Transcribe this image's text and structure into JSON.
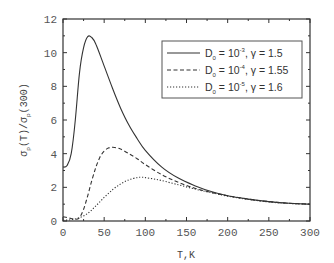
{
  "chart_data": {
    "type": "line",
    "title": "",
    "xlabel": "T,K",
    "ylabel": "σp(T)/σp(300)",
    "ylabel_parts": {
      "sigma": "σ",
      "sub": "p",
      "num_arg": "(T)",
      "slash": "/",
      "den_arg": "(300)"
    },
    "xlim": [
      0,
      300
    ],
    "ylim": [
      0,
      12
    ],
    "x_ticks": [
      0,
      50,
      100,
      150,
      200,
      250,
      300
    ],
    "x_tick_labels": [
      "0",
      "50",
      "100",
      "150",
      "200",
      "250",
      "300"
    ],
    "x_minor_ticks": [
      25,
      75,
      125,
      175,
      225,
      275
    ],
    "y_ticks": [
      0,
      2,
      4,
      6,
      8,
      10,
      12
    ],
    "y_tick_labels": [
      "0",
      "2",
      "4",
      "6",
      "8",
      "10",
      "12"
    ],
    "y_minor_ticks": [
      1,
      3,
      5,
      7,
      9,
      11
    ],
    "grid": false,
    "legend_position": "upper right",
    "series": [
      {
        "name": "D0 = 10^-3, γ = 1.5",
        "legend": {
          "d": "D",
          "sub": "0",
          "eq": " = 10",
          "sup": "-3",
          "rest": ", γ = 1.5"
        },
        "style": "solid",
        "x": [
          0,
          5,
          10,
          15,
          20,
          25,
          30,
          35,
          40,
          50,
          60,
          70,
          80,
          90,
          100,
          120,
          140,
          160,
          180,
          200,
          225,
          250,
          275,
          300
        ],
        "y": [
          3.2,
          3.3,
          4.0,
          6.0,
          8.8,
          10.3,
          10.95,
          10.9,
          10.5,
          9.2,
          7.9,
          6.7,
          5.7,
          4.9,
          4.2,
          3.2,
          2.55,
          2.1,
          1.75,
          1.5,
          1.3,
          1.15,
          1.05,
          1.0
        ]
      },
      {
        "name": "D0 = 10^-4, γ = 1.55",
        "legend": {
          "d": "D",
          "sub": "0",
          "eq": " = 10",
          "sup": "-4",
          "rest": ", γ = 1.55"
        },
        "style": "dashed",
        "x": [
          0,
          5,
          10,
          15,
          20,
          25,
          30,
          35,
          40,
          45,
          50,
          55,
          60,
          65,
          70,
          80,
          90,
          100,
          120,
          140,
          160,
          180,
          200,
          225,
          250,
          275,
          300
        ],
        "y": [
          0.25,
          0.2,
          0.15,
          0.1,
          0.2,
          0.7,
          1.5,
          2.4,
          3.2,
          3.8,
          4.15,
          4.33,
          4.38,
          4.35,
          4.28,
          4.0,
          3.7,
          3.35,
          2.75,
          2.3,
          1.95,
          1.7,
          1.5,
          1.3,
          1.15,
          1.05,
          1.0
        ]
      },
      {
        "name": "D0 = 10^-5, γ = 1.6",
        "legend": {
          "d": "D",
          "sub": "0",
          "eq": " = 10",
          "sup": "-5",
          "rest": ", γ = 1.6"
        },
        "style": "dotted",
        "x": [
          0,
          10,
          20,
          30,
          40,
          50,
          60,
          70,
          80,
          90,
          95,
          100,
          110,
          120,
          140,
          160,
          180,
          200,
          225,
          250,
          275,
          300
        ],
        "y": [
          0.05,
          0.08,
          0.2,
          0.45,
          0.9,
          1.4,
          1.85,
          2.2,
          2.45,
          2.58,
          2.6,
          2.58,
          2.5,
          2.4,
          2.15,
          1.9,
          1.68,
          1.48,
          1.28,
          1.13,
          1.04,
          1.0
        ]
      }
    ]
  },
  "colors": {
    "axis": "#333333",
    "line": "#333333",
    "tick_text": "#555555",
    "background": "#ffffff"
  }
}
